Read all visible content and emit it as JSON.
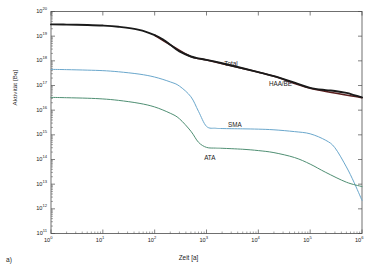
{
  "figure": {
    "panel_tag": "a)",
    "xlabel": "Zeit [a]",
    "ylabel": "Aktivität [Bq]"
  },
  "colors": {
    "total": "#1a1a1a",
    "haa_be": "#5b1f1f",
    "sma": "#6aa7cc",
    "ata": "#4f8f73",
    "axis": "#4d4d4d",
    "background": "#ffffff"
  },
  "labels": {
    "total": "Total",
    "haa_be": "HAA/BE",
    "sma": "SMA",
    "ata": "ATA"
  },
  "xticks": [
    {
      "label": "10",
      "exp": "0"
    },
    {
      "label": "10",
      "exp": "1"
    },
    {
      "label": "10",
      "exp": "2"
    },
    {
      "label": "10",
      "exp": "3"
    },
    {
      "label": "10",
      "exp": "4"
    },
    {
      "label": "10",
      "exp": "5"
    },
    {
      "label": "10",
      "exp": "6"
    }
  ],
  "yticks": [
    {
      "label": "10",
      "exp": "20"
    },
    {
      "label": "10",
      "exp": "19"
    },
    {
      "label": "10",
      "exp": "18"
    },
    {
      "label": "10",
      "exp": "17"
    },
    {
      "label": "10",
      "exp": "16"
    },
    {
      "label": "10",
      "exp": "15"
    },
    {
      "label": "10",
      "exp": "14"
    },
    {
      "label": "10",
      "exp": "13"
    },
    {
      "label": "10",
      "exp": "12"
    },
    {
      "label": "10",
      "exp": "11"
    }
  ],
  "chart_data": {
    "type": "line",
    "title": "",
    "xlabel": "Zeit [a]",
    "ylabel": "Aktivität [Bq]",
    "xscale": "log",
    "yscale": "log",
    "xlim": [
      1,
      1000000
    ],
    "ylim": [
      100000000000.0,
      1e+20
    ],
    "grid": false,
    "legend": "inline-annotations",
    "annotations": [
      {
        "text": "Total",
        "x": 2200,
        "y": 7.5e+17
      },
      {
        "text": "HAA/BE",
        "x": 16000,
        "y": 1.2e+17
      },
      {
        "text": "SMA",
        "x": 2600,
        "y": 2600000000000000.0
      },
      {
        "text": "ATA",
        "x": 900,
        "y": 110000000000000.0
      }
    ],
    "series": [
      {
        "name": "Total",
        "color": "#1a1a1a",
        "x": [
          1,
          2,
          5,
          10,
          20,
          50,
          100,
          150,
          200,
          300,
          500,
          700,
          1000,
          2000,
          5000,
          10000,
          20000,
          50000,
          100000,
          200000,
          300000,
          500000,
          700000,
          1000000
        ],
        "y": [
          3e+19,
          2.95e+19,
          2.85e+19,
          2.7e+19,
          2.4e+19,
          1.8e+19,
          1.1e+19,
          7e+18,
          4.5e+18,
          2.4e+18,
          1.5e+18,
          1.25e+18,
          1.1e+18,
          8e+17,
          5e+17,
          3.5e+17,
          2.4e+17,
          1.3e+17,
          8e+16,
          6.5e+16,
          6e+16,
          5e+16,
          4.1e+16,
          3.3e+16
        ]
      },
      {
        "name": "HAA/BE",
        "color": "#5b1f1f",
        "x": [
          100,
          200,
          500,
          1000,
          5000,
          20000,
          100000,
          1000000
        ],
        "y": [
          1.09e+19,
          4.45e+18,
          1.48e+18,
          1.08e+18,
          4.9e+17,
          2.35e+17,
          7.8e+16,
          3.2e+16
        ]
      },
      {
        "name": "SMA",
        "color": "#6aa7cc",
        "x": [
          1,
          2,
          5,
          10,
          20,
          50,
          100,
          200,
          300,
          500,
          700,
          1000,
          1500,
          2000,
          5000,
          10000,
          20000,
          50000,
          100000,
          200000,
          300000,
          500000,
          700000,
          1000000
        ],
        "y": [
          4.5e+17,
          4.4e+17,
          4.2e+17,
          4e+17,
          3.6e+17,
          2.9e+17,
          2.2e+17,
          1.4e+17,
          9.5e+16,
          3.5e+16,
          9000000000000000.0,
          2200000000000000.0,
          1850000000000000.0,
          1800000000000000.0,
          1750000000000000.0,
          1700000000000000.0,
          1600000000000000.0,
          1350000000000000.0,
          1100000000000000.0,
          600000000000000.0,
          300000000000000.0,
          50000000000000.0,
          12000000000000.0,
          2200000000000.0
        ]
      },
      {
        "name": "ATA",
        "color": "#4f8f73",
        "x": [
          1,
          2,
          5,
          10,
          20,
          50,
          100,
          200,
          300,
          500,
          700,
          1000,
          1500,
          2000,
          5000,
          10000,
          20000,
          50000,
          100000,
          200000,
          500000,
          1000000
        ],
        "y": [
          3.3e+16,
          3.2e+16,
          3.05e+16,
          2.85e+16,
          2.5e+16,
          1.9e+16,
          1.35e+16,
          7500000000000000.0,
          4500000000000000.0,
          1400000000000000.0,
          500000000000000.0,
          310000000000000.0,
          290000000000000.0,
          285000000000000.0,
          260000000000000.0,
          230000000000000.0,
          190000000000000.0,
          120000000000000.0,
          65000000000000.0,
          30000000000000.0,
          12000000000000.0,
          8000000000000.0
        ]
      }
    ]
  }
}
